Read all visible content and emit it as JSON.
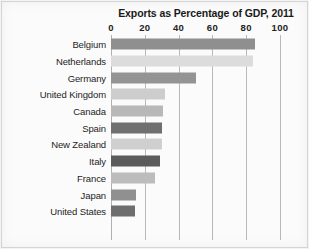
{
  "chart_data": {
    "type": "bar",
    "orientation": "horizontal",
    "title": "Exports as Percentage of GDP, 2011",
    "xlabel": "",
    "ylabel": "",
    "xlim": [
      0,
      100
    ],
    "xticks": [
      0,
      20,
      40,
      60,
      80,
      100
    ],
    "xtick_labels": [
      "0",
      "20",
      "40",
      "60",
      "80",
      "100"
    ],
    "grid": true,
    "legend": "none",
    "categories": [
      "Belgium",
      "Netherlands",
      "Germany",
      "United Kingdom",
      "Canada",
      "Spain",
      "New Zealand",
      "Italy",
      "France",
      "Japan",
      "United States"
    ],
    "values": [
      85,
      84,
      50,
      32,
      31,
      30,
      30,
      29,
      26,
      15,
      14
    ],
    "bar_colors": [
      "#8f8f8f",
      "#dcdcdc",
      "#949494",
      "#cdcdcd",
      "#b8b8b8",
      "#6f6f6f",
      "#cfcfcf",
      "#5b5b5b",
      "#bcbcbc",
      "#909090",
      "#6e6e6e"
    ],
    "bars": [
      {
        "label": "Belgium",
        "value": 85,
        "color": "#8f8f8f"
      },
      {
        "label": "Netherlands",
        "value": 84,
        "color": "#dcdcdc"
      },
      {
        "label": "Germany",
        "value": 50,
        "color": "#949494"
      },
      {
        "label": "United Kingdom",
        "value": 32,
        "color": "#cdcdcd"
      },
      {
        "label": "Canada",
        "value": 31,
        "color": "#b8b8b8"
      },
      {
        "label": "Spain",
        "value": 30,
        "color": "#6f6f6f"
      },
      {
        "label": "New Zealand",
        "value": 30,
        "color": "#cfcfcf"
      },
      {
        "label": "Italy",
        "value": 29,
        "color": "#5b5b5b"
      },
      {
        "label": "France",
        "value": 26,
        "color": "#bcbcbc"
      },
      {
        "label": "Japan",
        "value": 15,
        "color": "#909090"
      },
      {
        "label": "United States",
        "value": 14,
        "color": "#6e6e6e"
      }
    ]
  },
  "style": {
    "background": "#fbfbfb",
    "gridline_color": "#b9b9b9",
    "text_color": "#1a1a1a",
    "frame_color": "#d7d7d7"
  }
}
